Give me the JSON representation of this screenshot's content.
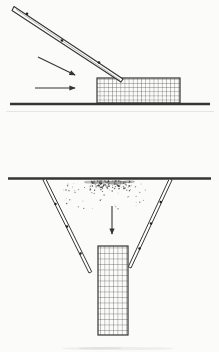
{
  "figure": {
    "panel_count": 2,
    "panels": [
      {
        "name": "inclined-chute-placement",
        "elements": [
          "inclined-chute",
          "chute-marks",
          "diagonal-flow-arrow",
          "horizontal-flow-arrow",
          "hatched-fill-block",
          "ground-line"
        ]
      },
      {
        "name": "vertical-drop-placement",
        "elements": [
          "ground-line",
          "spoil-stipple",
          "left-funnel-wall",
          "right-funnel-wall",
          "wall-marks",
          "down-arrow",
          "hatched-fill-column",
          "scan-smudge"
        ]
      }
    ]
  },
  "colors": {
    "paper": "#fbfbf9",
    "ink": "#353535",
    "grid_ink": "#4a4a4a",
    "soft_ink": "#8a8a8a",
    "echo": "#dedede"
  },
  "stipple": {
    "seed": 7,
    "dense": {
      "count": 85,
      "cx": 108,
      "cy": 184,
      "rx": 24,
      "ry": 4.5
    },
    "spray": {
      "count": 60,
      "x_min": 63,
      "x_max": 146,
      "y_min": 183,
      "y_max": 209
    }
  }
}
